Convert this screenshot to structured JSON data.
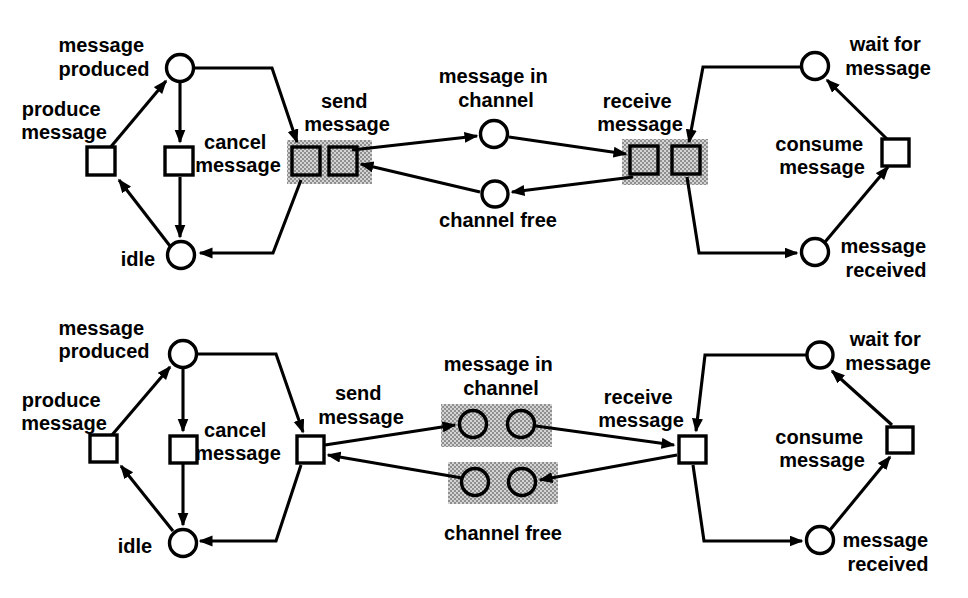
{
  "figure": {
    "background_color": "#ffffff",
    "line_color": "#000000",
    "shade_light": "#d4d4d4",
    "shade_dark": "#8f8f8f"
  },
  "labels": {
    "message_produced": [
      "message",
      "produced"
    ],
    "produce_message": [
      "produce",
      "message"
    ],
    "cancel_message": [
      "cancel",
      "message"
    ],
    "idle": [
      "idle"
    ],
    "send_message": [
      "send",
      "message"
    ],
    "message_in_channel": [
      "message in",
      "channel"
    ],
    "channel_free": [
      "channel free"
    ],
    "receive_message": [
      "receive",
      "message"
    ],
    "wait_for_message": [
      "wait for",
      "message"
    ],
    "consume_message": [
      "consume",
      "message"
    ],
    "message_received": [
      "message",
      "received"
    ]
  },
  "diagram_data": {
    "type": "diagram",
    "subtype": "petri_net_message_channel_pair",
    "nets": [
      {
        "position": "top",
        "shading": "send message and receive message are each drawn as a shaded pair of transition squares",
        "places": [
          "message produced",
          "idle",
          "message in channel",
          "channel free",
          "wait for message",
          "message received"
        ],
        "transitions": [
          "produce message",
          "cancel message",
          "send message (shaded pair)",
          "receive message (shaded pair)",
          "consume message"
        ]
      },
      {
        "position": "bottom",
        "shading": "message in channel and channel free are each drawn as a shaded pair of place circles",
        "places": [
          "message produced",
          "idle",
          "message in channel (shaded pair)",
          "channel free (shaded pair)",
          "wait for message",
          "message received"
        ],
        "transitions": [
          "produce message",
          "cancel message",
          "send message",
          "receive message",
          "consume message"
        ]
      }
    ],
    "arcs": [
      [
        "produce message",
        "message produced"
      ],
      [
        "message produced",
        "cancel message"
      ],
      [
        "cancel message",
        "idle"
      ],
      [
        "idle",
        "produce message"
      ],
      [
        "message produced",
        "send message"
      ],
      [
        "send message",
        "idle"
      ],
      [
        "send message",
        "message in channel"
      ],
      [
        "channel free",
        "send message"
      ],
      [
        "message in channel",
        "receive message"
      ],
      [
        "receive message",
        "channel free"
      ],
      [
        "wait for message",
        "receive message"
      ],
      [
        "receive message",
        "message received"
      ],
      [
        "message received",
        "consume message"
      ],
      [
        "consume message",
        "wait for message"
      ]
    ]
  }
}
